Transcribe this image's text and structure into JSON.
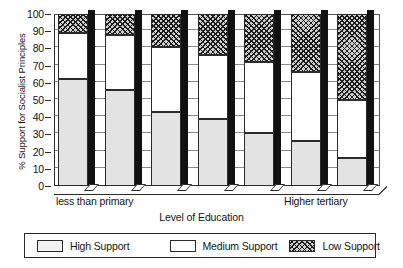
{
  "chart_data": {
    "type": "bar",
    "subtype": "stacked-percent",
    "title": "",
    "xlabel": "Level of Education",
    "ylabel": "% Support for Socialist Principles",
    "ylim": [
      0,
      100
    ],
    "ytick_step": 10,
    "yticks": [
      0,
      10,
      20,
      30,
      40,
      50,
      60,
      70,
      80,
      90,
      100
    ],
    "grid": true,
    "legend_position": "bottom",
    "categories": [
      "1",
      "2",
      "3",
      "4",
      "5",
      "6",
      "7"
    ],
    "category_end_labels": {
      "first": "less than primary",
      "last": "Higher tertiary"
    },
    "series": [
      {
        "name": "High Support",
        "values": [
          62,
          56,
          43,
          39,
          31,
          26,
          16
        ],
        "fill": "light-gray",
        "color": "#e3e3e3"
      },
      {
        "name": "Medium Support",
        "values": [
          27,
          32,
          38,
          37,
          41,
          40,
          34
        ],
        "fill": "white",
        "color": "#ffffff"
      },
      {
        "name": "Low Support",
        "values": [
          11,
          12,
          19,
          24,
          28,
          34,
          50
        ],
        "fill": "cross-hatch",
        "color": "#cfcfcf"
      }
    ],
    "cumulative_tops": {
      "high": [
        62,
        56,
        43,
        39,
        31,
        26,
        16
      ],
      "medium": [
        89,
        88,
        81,
        76,
        72,
        66,
        50
      ]
    }
  },
  "axes": {
    "y_title": "% Support for Socialist Principles",
    "x_title": "Level of Education",
    "y_tick_labels": [
      "100",
      "90",
      "80",
      "70",
      "60",
      "50",
      "40",
      "30",
      "20",
      "10",
      "0"
    ],
    "x_tick_labels": [
      "less than primary",
      "Higher tertiary"
    ]
  },
  "legend": {
    "items": [
      {
        "label": "High Support",
        "swatch": "light-gray-box"
      },
      {
        "label": "Medium Support",
        "swatch": "white-box"
      },
      {
        "label": "Low Support",
        "swatch": "hatched-box"
      }
    ]
  }
}
